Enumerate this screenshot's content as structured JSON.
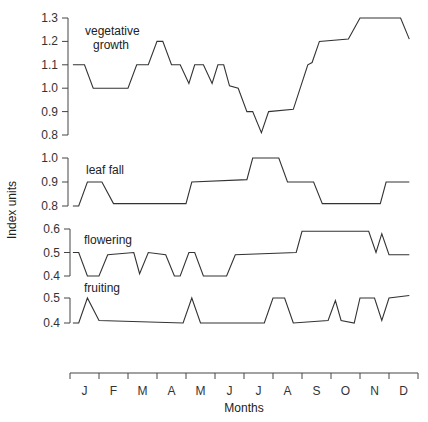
{
  "chart_data": {
    "type": "line",
    "title": "",
    "xlabel": "Months",
    "ylabel": "Index units",
    "categories": [
      "J",
      "F",
      "M",
      "A",
      "M",
      "J",
      "J",
      "A",
      "S",
      "O",
      "N",
      "D"
    ],
    "grid": false,
    "legend": "inline labels",
    "x_domain_months": [
      0,
      12
    ],
    "panels": [
      {
        "name": "vegetative growth",
        "label_lines": [
          "vegetative",
          "growth"
        ],
        "ylim": [
          0.8,
          1.3
        ],
        "yticks": [
          "1.3",
          "1.2",
          "1.1",
          "1.0",
          "0.9",
          "0.8"
        ],
        "points": [
          [
            0.1,
            1.1
          ],
          [
            0.5,
            1.1
          ],
          [
            0.8,
            1.0
          ],
          [
            2.0,
            1.0
          ],
          [
            2.3,
            1.1
          ],
          [
            2.7,
            1.1
          ],
          [
            3.0,
            1.2
          ],
          [
            3.2,
            1.2
          ],
          [
            3.5,
            1.1
          ],
          [
            3.8,
            1.1
          ],
          [
            4.1,
            1.02
          ],
          [
            4.3,
            1.1
          ],
          [
            4.6,
            1.1
          ],
          [
            4.9,
            1.02
          ],
          [
            5.1,
            1.1
          ],
          [
            5.3,
            1.1
          ],
          [
            5.5,
            1.01
          ],
          [
            5.8,
            1.0
          ],
          [
            6.1,
            0.9
          ],
          [
            6.3,
            0.9
          ],
          [
            6.6,
            0.81
          ],
          [
            6.85,
            0.9
          ],
          [
            7.7,
            0.91
          ],
          [
            8.2,
            1.1
          ],
          [
            8.35,
            1.11
          ],
          [
            8.6,
            1.2
          ],
          [
            9.6,
            1.21
          ],
          [
            10.0,
            1.3
          ],
          [
            11.4,
            1.3
          ],
          [
            11.7,
            1.21
          ]
        ]
      },
      {
        "name": "leaf fall",
        "label_lines": [
          "leaf fall"
        ],
        "ylim": [
          0.8,
          1.0
        ],
        "yticks": [
          "1.0",
          "0.9",
          "0.8"
        ],
        "points": [
          [
            0.1,
            0.8
          ],
          [
            0.3,
            0.8
          ],
          [
            0.6,
            0.9
          ],
          [
            1.1,
            0.9
          ],
          [
            1.5,
            0.81
          ],
          [
            4.0,
            0.81
          ],
          [
            4.2,
            0.9
          ],
          [
            6.1,
            0.91
          ],
          [
            6.3,
            1.0
          ],
          [
            7.2,
            1.0
          ],
          [
            7.5,
            0.9
          ],
          [
            8.4,
            0.9
          ],
          [
            8.7,
            0.81
          ],
          [
            10.7,
            0.81
          ],
          [
            10.9,
            0.9
          ],
          [
            11.7,
            0.9
          ]
        ]
      },
      {
        "name": "flowering",
        "label_lines": [
          "flowering"
        ],
        "ylim": [
          0.4,
          0.6
        ],
        "yticks": [
          "0.6",
          "0.5",
          "0.4"
        ],
        "points": [
          [
            0.1,
            0.5
          ],
          [
            0.3,
            0.5
          ],
          [
            0.6,
            0.4
          ],
          [
            1.0,
            0.4
          ],
          [
            1.3,
            0.49
          ],
          [
            2.2,
            0.5
          ],
          [
            2.4,
            0.41
          ],
          [
            2.7,
            0.5
          ],
          [
            3.3,
            0.49
          ],
          [
            3.6,
            0.4
          ],
          [
            3.8,
            0.4
          ],
          [
            4.1,
            0.5
          ],
          [
            4.3,
            0.5
          ],
          [
            4.6,
            0.4
          ],
          [
            5.4,
            0.4
          ],
          [
            5.7,
            0.49
          ],
          [
            7.8,
            0.5
          ],
          [
            8.0,
            0.59
          ],
          [
            10.3,
            0.59
          ],
          [
            10.55,
            0.5
          ],
          [
            10.75,
            0.58
          ],
          [
            11.0,
            0.49
          ],
          [
            11.7,
            0.49
          ]
        ]
      },
      {
        "name": "fruiting",
        "label_lines": [
          "fruiting"
        ],
        "ylim": [
          0.4,
          0.5
        ],
        "yticks": [
          "0.5",
          "0.4"
        ],
        "points": [
          [
            0.1,
            0.4
          ],
          [
            0.3,
            0.4
          ],
          [
            0.6,
            0.5
          ],
          [
            1.0,
            0.41
          ],
          [
            3.9,
            0.4
          ],
          [
            4.2,
            0.5
          ],
          [
            4.5,
            0.4
          ],
          [
            6.7,
            0.4
          ],
          [
            7.0,
            0.5
          ],
          [
            7.4,
            0.5
          ],
          [
            7.7,
            0.4
          ],
          [
            8.9,
            0.41
          ],
          [
            9.15,
            0.49
          ],
          [
            9.35,
            0.41
          ],
          [
            9.8,
            0.4
          ],
          [
            10.0,
            0.5
          ],
          [
            10.5,
            0.5
          ],
          [
            10.75,
            0.41
          ],
          [
            11.0,
            0.5
          ],
          [
            11.7,
            0.51
          ]
        ]
      }
    ]
  },
  "layout": {
    "x_axis": {
      "left_px": 70,
      "right_px": 418,
      "baseline_px": 373,
      "tick_len": 6
    },
    "panels_px": [
      {
        "top": 18,
        "bottom": 135,
        "axis_x": 68,
        "label_x": 85,
        "label_y": [
          35,
          49
        ]
      },
      {
        "top": 158,
        "bottom": 206,
        "axis_x": 68,
        "label_x": 86,
        "label_y": [
          174
        ]
      },
      {
        "top": 229,
        "bottom": 276,
        "axis_x": 70,
        "label_x": 84,
        "label_y": [
          244
        ]
      },
      {
        "top": 298,
        "bottom": 323,
        "axis_x": 70,
        "label_x": 84,
        "label_y": [
          292
        ]
      }
    ]
  }
}
